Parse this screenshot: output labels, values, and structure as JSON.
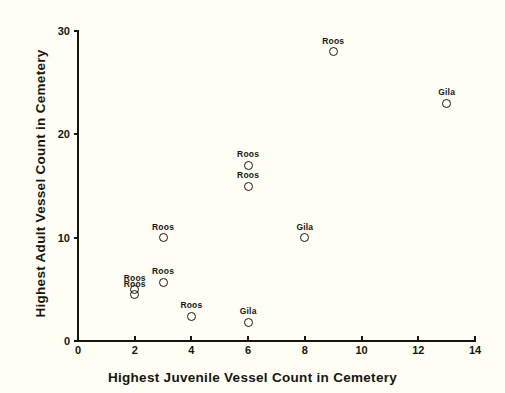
{
  "chart_data": {
    "type": "scatter",
    "title": "",
    "xlabel": "Highest Juvenile Vessel Count in Cemetery",
    "ylabel": "Highest Adult Vessel Count in Cemetery",
    "xlim": [
      0,
      14
    ],
    "ylim": [
      0,
      30
    ],
    "xticks": [
      0,
      2,
      4,
      6,
      8,
      10,
      12,
      14
    ],
    "yticks": [
      0,
      10,
      20,
      30
    ],
    "grid": false,
    "legend": false,
    "marker": "open-circle",
    "point_label_position": "above",
    "series": [
      {
        "name": "Roos",
        "points": [
          {
            "x": 2,
            "y": 5.0,
            "label": "Roos"
          },
          {
            "x": 2,
            "y": 4.5,
            "label": "Roos"
          },
          {
            "x": 3,
            "y": 5.7,
            "label": "Roos"
          },
          {
            "x": 3,
            "y": 10.0,
            "label": "Roos"
          },
          {
            "x": 4,
            "y": 2.4,
            "label": "Roos"
          },
          {
            "x": 6,
            "y": 17.0,
            "label": "Roos"
          },
          {
            "x": 6,
            "y": 15.0,
            "label": "Roos"
          },
          {
            "x": 9,
            "y": 28.0,
            "label": "Roos"
          }
        ]
      },
      {
        "name": "Gila",
        "points": [
          {
            "x": 6,
            "y": 1.8,
            "label": "Gila"
          },
          {
            "x": 8,
            "y": 10.0,
            "label": "Gila"
          },
          {
            "x": 13,
            "y": 23.0,
            "label": "Gila"
          }
        ]
      }
    ],
    "colors": {
      "background": "#fffef5",
      "axis": "#16160f",
      "marker_stroke": "#16160f",
      "text": "#16160f"
    }
  }
}
